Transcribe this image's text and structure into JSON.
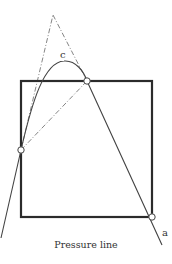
{
  "diagram": {
    "labels": {
      "curve": "c",
      "line": "a",
      "caption": "Pressure line"
    },
    "colors": {
      "frame": "#2b2b2b",
      "line": "#444444",
      "construction": "#777777",
      "node_fill": "#ffffff"
    }
  }
}
